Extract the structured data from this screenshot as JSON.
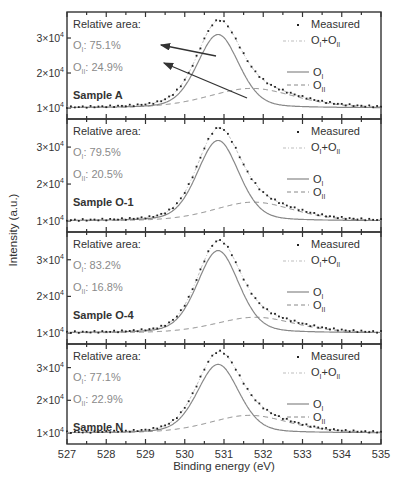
{
  "chart_data": {
    "type": "line",
    "title": "",
    "xlabel": "Binding energy (eV)",
    "ylabel": "Intensity (a.u.)",
    "xlim": [
      535,
      527
    ],
    "x_axis_display_order": [
      527,
      528,
      529,
      530,
      531,
      532,
      533,
      534,
      535
    ],
    "x_tick_labels": [
      "527",
      "528",
      "529",
      "530",
      "531",
      "532",
      "533",
      "534",
      "535"
    ],
    "y_tick_labels": [
      "1×10⁴",
      "2×10⁴",
      "3×10⁴"
    ],
    "y_ticks": [
      10000,
      20000,
      30000
    ],
    "grid": false,
    "legend": {
      "position": "upper right (each panel)",
      "entries": [
        {
          "label": "Measured",
          "style": "dots"
        },
        {
          "label": "OI+OII",
          "style": "light dash-dot"
        },
        {
          "label": "OI",
          "style": "solid"
        },
        {
          "label": "OII",
          "style": "dashed"
        }
      ]
    },
    "panels": [
      {
        "sample": "Sample A",
        "relative_area_label": "Relative area:",
        "OI_percent": "75.1%",
        "OII_percent": "24.9%",
        "baseline": 10000,
        "OI_peak_eV": 530.85,
        "OI_peak_height": 21000,
        "OI_fwhm": 1.25,
        "OII_peak_eV": 531.7,
        "OII_peak_height": 5600,
        "OII_fwhm": 2.6,
        "arrows": true
      },
      {
        "sample": "Sample O-1",
        "relative_area_label": "Relative area:",
        "OI_percent": "79.5%",
        "OII_percent": "20.5%",
        "baseline": 10000,
        "OI_peak_eV": 530.85,
        "OI_peak_height": 21800,
        "OI_fwhm": 1.25,
        "OII_peak_eV": 531.75,
        "OII_peak_height": 5100,
        "OII_fwhm": 2.4,
        "arrows": false
      },
      {
        "sample": "Sample O-4",
        "relative_area_label": "Relative area:",
        "OI_percent": "83.2%",
        "OII_percent": "16.8%",
        "baseline": 10000,
        "OI_peak_eV": 530.85,
        "OI_peak_height": 22500,
        "OI_fwhm": 1.25,
        "OII_peak_eV": 531.8,
        "OII_peak_height": 4300,
        "OII_fwhm": 2.4,
        "arrows": false
      },
      {
        "sample": "Sample N",
        "relative_area_label": "Relative area:",
        "OI_percent": "77.1%",
        "OII_percent": "22.9%",
        "baseline": 10000,
        "OI_peak_eV": 530.85,
        "OI_peak_height": 21000,
        "OI_fwhm": 1.25,
        "OII_peak_eV": 531.65,
        "OII_peak_height": 5400,
        "OII_fwhm": 2.4,
        "arrows": false
      }
    ]
  },
  "labels": {
    "xlabel": "Binding energy (eV)",
    "ylabel": "Intensity (a.u.)",
    "legend_measured": "Measured",
    "legend_sum_base": "O",
    "legend_sum_sub1": "I",
    "legend_sum_plus": "+O",
    "legend_sum_sub2": "II",
    "legend_oi_base": "O",
    "legend_oi_sub": "I",
    "legend_oii_base": "O",
    "legend_oii_sub": "II"
  },
  "colors": {
    "axis": "#333333",
    "measured": "#222222",
    "oi_line": "#888888",
    "oii_line": "#888888",
    "sum_line": "#bdbdbd",
    "percent_text": "#8a8a8a",
    "label_text": "#333333",
    "arrow": "#333333"
  }
}
